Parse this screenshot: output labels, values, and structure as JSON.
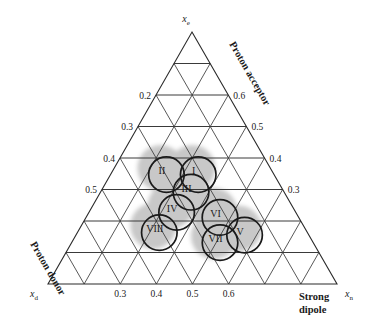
{
  "figure": {
    "type": "ternary-diagram",
    "title": "",
    "background_color": "#ffffff",
    "line_color": "#2b2b2b",
    "blob_color": "#c8c8c8",
    "outline_color": "#1a1a1a"
  },
  "corners": {
    "top": {
      "symbol": "x",
      "sub": "e"
    },
    "bottom_left": {
      "symbol": "x",
      "sub": "d"
    },
    "bottom_right": {
      "symbol": "x",
      "sub": "n"
    }
  },
  "edge_labels": {
    "right": "Proton acceptor",
    "left": "Proton donor",
    "bottom_line1": "Strong",
    "bottom_line2": "dipole"
  },
  "axes": {
    "left": {
      "name": "Proton donor",
      "ticks": [
        "0.2",
        "0.3",
        "0.4",
        "0.5"
      ]
    },
    "right": {
      "name": "Proton acceptor",
      "ticks": [
        "0.6",
        "0.5",
        "0.4",
        "0.3"
      ]
    },
    "bottom": {
      "name": "Strong dipole",
      "ticks": [
        "0.3",
        "0.4",
        "0.5",
        "0.6"
      ]
    }
  },
  "chart_data": {
    "type": "scatter",
    "title": "",
    "xlabel": "Strong dipole",
    "ylabel": "Proton acceptor",
    "zlabel": "Proton donor",
    "axis_vars": [
      "x_d",
      "x_e",
      "x_n"
    ],
    "grid": true,
    "legend": "none",
    "left_ticks": [
      0.2,
      0.3,
      0.4,
      0.5
    ],
    "right_ticks": [
      0.6,
      0.5,
      0.4,
      0.3
    ],
    "bottom_ticks": [
      0.3,
      0.4,
      0.5,
      0.6
    ],
    "clusters": [
      {
        "label": "I",
        "xd": 0.27,
        "xe": 0.45,
        "xn": 0.28,
        "radius": 0.075
      },
      {
        "label": "II",
        "xd": 0.38,
        "xe": 0.45,
        "xn": 0.17,
        "radius": 0.075
      },
      {
        "label": "III",
        "xd": 0.33,
        "xe": 0.38,
        "xn": 0.29,
        "radius": 0.075
      },
      {
        "label": "IV",
        "xd": 0.42,
        "xe": 0.3,
        "xn": 0.28,
        "radius": 0.075
      },
      {
        "label": "V",
        "xd": 0.23,
        "xe": 0.21,
        "xn": 0.56,
        "radius": 0.075
      },
      {
        "label": "VI",
        "xd": 0.28,
        "xe": 0.28,
        "xn": 0.44,
        "radius": 0.075
      },
      {
        "label": "VII",
        "xd": 0.33,
        "xe": 0.18,
        "xn": 0.49,
        "radius": 0.075
      },
      {
        "label": "VIII",
        "xd": 0.52,
        "xe": 0.22,
        "xn": 0.26,
        "radius": 0.075
      }
    ]
  },
  "clusters": [
    {
      "label": "I"
    },
    {
      "label": "II"
    },
    {
      "label": "III"
    },
    {
      "label": "IV"
    },
    {
      "label": "V"
    },
    {
      "label": "VI"
    },
    {
      "label": "VII"
    },
    {
      "label": "VIII"
    }
  ],
  "tick_labels": {
    "left": [
      "0.2",
      "0.3",
      "0.4",
      "0.5"
    ],
    "right": [
      "0.6",
      "0.5",
      "0.4",
      "0.3"
    ],
    "bottom": [
      "0.3",
      "0.4",
      "0.5",
      "0.6"
    ]
  }
}
